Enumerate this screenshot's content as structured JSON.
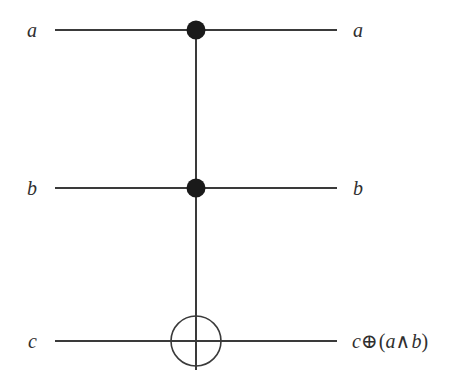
{
  "figure": {
    "background_color": "#ffffff",
    "ink_color": "#302f2f",
    "width": 453,
    "height": 388
  },
  "circuit": {
    "type": "quantum-logic-circuit",
    "gate_name": "Toffoli",
    "control_line_x": 196,
    "wire_x_start": 55,
    "wire_x_end": 337,
    "wires": [
      {
        "id": "wire-a",
        "y": 30,
        "input_label": "a",
        "output_label": "a",
        "node": "control-dot"
      },
      {
        "id": "wire-b",
        "y": 188,
        "input_label": "b",
        "output_label": "b",
        "node": "control-dot"
      },
      {
        "id": "wire-c",
        "y": 341,
        "input_label": "c",
        "output_label_parts": {
          "var1": "c",
          "xor": "⊕",
          "open_paren": "(",
          "var2": "a",
          "and": "∧",
          "var3": "b",
          "close_paren": ")"
        },
        "output_label": "c ⊕ (a ∧ b)",
        "node": "target-circle"
      }
    ],
    "control_dots": [
      {
        "id": "control-dot-a",
        "cx": 196,
        "cy": 30,
        "r": 9,
        "fill": "#1a1a1a"
      },
      {
        "id": "control-dot-b",
        "cx": 196,
        "cy": 188,
        "r": 9,
        "fill": "#1a1a1a"
      }
    ],
    "target": {
      "id": "target-xor",
      "cx": 196,
      "cy": 341,
      "r": 25,
      "stroke": "#3a3a3a",
      "fill": "none"
    },
    "vertical_line": {
      "x": 196,
      "y_top": 30,
      "y_bottom": 370
    },
    "stroke_width": 1.6
  }
}
